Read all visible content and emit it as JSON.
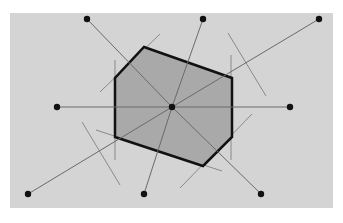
{
  "diagram": {
    "type": "voronoi-cell",
    "background": {
      "x": 10,
      "y": 13,
      "width": 323,
      "height": 195,
      "color": "#d4d4d4"
    },
    "cell_fill": "#a9a9a9",
    "cell_stroke": "#111111",
    "bisector_color": "#8a8a8a",
    "spoke_color": "#6a6a6a",
    "point_color": "#111111",
    "center": {
      "x": 172,
      "y": 107
    },
    "sites": [
      {
        "x": 87,
        "y": 19
      },
      {
        "x": 203,
        "y": 19
      },
      {
        "x": 319,
        "y": 19
      },
      {
        "x": 57,
        "y": 107
      },
      {
        "x": 290,
        "y": 107
      },
      {
        "x": 28,
        "y": 194
      },
      {
        "x": 144,
        "y": 194
      },
      {
        "x": 261,
        "y": 194
      }
    ],
    "cell_vertices": [
      {
        "x": 144,
        "y": 47
      },
      {
        "x": 232,
        "y": 78
      },
      {
        "x": 232,
        "y": 137
      },
      {
        "x": 203,
        "y": 166
      },
      {
        "x": 115,
        "y": 137
      },
      {
        "x": 115,
        "y": 78
      }
    ],
    "bisectors": [
      {
        "x1": 100,
        "y1": 92,
        "x2": 160,
        "y2": 34
      },
      {
        "x1": 152,
        "y1": 51,
        "x2": 222,
        "y2": 76
      },
      {
        "x1": 228,
        "y1": 33,
        "x2": 266,
        "y2": 96
      },
      {
        "x1": 115,
        "y1": 60,
        "x2": 115,
        "y2": 160
      },
      {
        "x1": 231,
        "y1": 55,
        "x2": 231,
        "y2": 160
      },
      {
        "x1": 82,
        "y1": 122,
        "x2": 120,
        "y2": 185
      },
      {
        "x1": 96,
        "y1": 130,
        "x2": 222,
        "y2": 171
      },
      {
        "x1": 180,
        "y1": 188,
        "x2": 252,
        "y2": 114
      }
    ]
  }
}
